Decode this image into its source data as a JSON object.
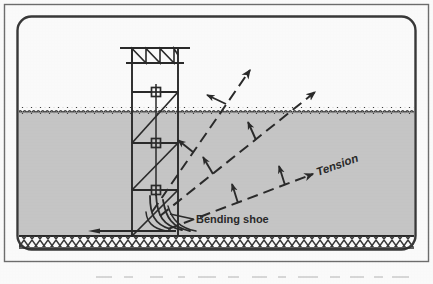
{
  "figure": {
    "domain_kind": "technical-diagram",
    "width": 433,
    "height": 284
  },
  "labels": {
    "tension": "Tension",
    "bending_shoe": "Bending shoe"
  },
  "colors": {
    "ink": "#2b2b2b",
    "ink_soft": "#4a4a4a",
    "water_fill": "#c9c9c9",
    "water_fill_edge": "#bdbdbd",
    "paper": "#ffffff",
    "frame_outer": "#6f6f6f",
    "frame_inner": "#3a3a3a",
    "caption_smudge": "#b9b9b9"
  },
  "frame": {
    "outer": {
      "x": 4,
      "y": 4,
      "width": 425,
      "height": 258,
      "radius": 0
    },
    "inner": {
      "x": 17,
      "y": 16,
      "width": 399,
      "height": 234,
      "radius": 14
    }
  },
  "scene": {
    "water_surface_y": 110,
    "water_bottom_y": 236,
    "seabed_band": {
      "top_y": 236,
      "bottom_y": 248
    },
    "water_left_x": 19,
    "water_right_x": 414
  },
  "tower": {
    "leg_left_x": 132,
    "leg_right_x": 178,
    "top_y": 48,
    "base_y": 236,
    "top_beam": {
      "y": 48,
      "x1": 122,
      "x2": 188
    },
    "truss_bottom_y": 63,
    "crossbeams_y": [
      92,
      143,
      190
    ],
    "sheave_x": 156,
    "sheaves_y": [
      92,
      143,
      190
    ],
    "sheave_size": 9
  },
  "pipe": {
    "seabed_run_y": 231,
    "seabed_run_x1": 88,
    "seabed_run_x2": 176,
    "shoe_apex_x": 156,
    "shoe_apex_y": 196
  },
  "tension_lines": [
    {
      "name": "inner-tension-line",
      "x1": 152,
      "y1": 212,
      "x2": 250,
      "y2": 70,
      "ticks": [
        {
          "t": 0.42,
          "angle": -118,
          "length": 17
        },
        {
          "t": 0.76,
          "angle": -118,
          "length": 17
        }
      ]
    },
    {
      "name": "outer-tension-line",
      "x1": 160,
      "y1": 216,
      "x2": 315,
      "y2": 92,
      "ticks": [
        {
          "t": 0.34,
          "angle": -104,
          "length": 17
        },
        {
          "t": 0.62,
          "angle": -104,
          "length": 17
        }
      ]
    },
    {
      "name": "labelled-tension-line",
      "x1": 168,
      "y1": 228,
      "x2": 320,
      "y2": 170,
      "ticks": [
        {
          "t": 0.52,
          "angle": -100,
          "length": 17
        }
      ]
    }
  ],
  "leader_lines": [
    {
      "name": "bending-shoe-leader",
      "x1": 172,
      "y1": 215,
      "x2": 192,
      "y2": 219
    }
  ],
  "caption_placeholder": {
    "visible_as": "illegible cropped text row at bottom edge of scan",
    "y": 277
  }
}
